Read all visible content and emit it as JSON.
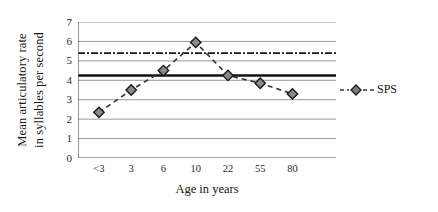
{
  "chart_data": {
    "type": "line",
    "title": "",
    "xlabel": "Age in years",
    "ylabel": "Mean articulatory rate in syllables per second",
    "ylabel_line1": "Mean articulatory rate",
    "ylabel_line2": "in syllables per second",
    "categories": [
      "<3",
      "3",
      "6",
      "10",
      "22",
      "55",
      "80"
    ],
    "x_tick_labels": [
      "<3",
      "3",
      "6",
      "10",
      "22",
      "55",
      "80"
    ],
    "y_tick_labels": [
      "0",
      "1",
      "2",
      "3",
      "4",
      "5",
      "6",
      "7"
    ],
    "y_ticks": [
      0,
      1,
      2,
      3,
      4,
      5,
      6,
      7
    ],
    "ylim": [
      0,
      7
    ],
    "grid": true,
    "grid_orientation": "horizontal",
    "legend_position": "right",
    "series": [
      {
        "name": "SPS",
        "marker": "diamond",
        "linestyle": "dashed",
        "color": "#3a3a3a",
        "values": [
          2.35,
          3.5,
          4.5,
          5.95,
          4.25,
          3.85,
          3.3
        ]
      }
    ],
    "reference_lines": [
      {
        "name": "upper-reference-line",
        "value": 5.4,
        "linestyle": "dash-dot",
        "color": "#1a1a1a"
      },
      {
        "name": "lower-reference-line",
        "value": 4.25,
        "linestyle": "solid",
        "color": "#111111"
      }
    ]
  },
  "legend": {
    "entries": [
      {
        "label": "SPS",
        "marker": "diamond",
        "linestyle": "dashed"
      }
    ]
  }
}
